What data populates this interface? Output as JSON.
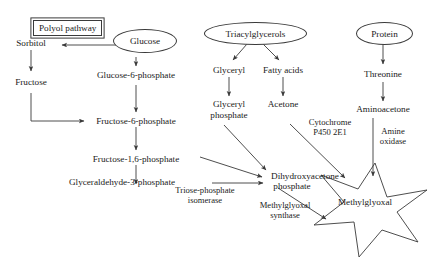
{
  "diagram": {
    "background_color": "#ffffff",
    "line_color": "#3a3a3a",
    "text_color": "#1a1a1a",
    "sources": {
      "glucose": "Glucose",
      "triacylglycerols": "Triacylglycerols",
      "protein": "Protein"
    },
    "box": {
      "polyol_pathway": "Polyol pathway"
    },
    "polyol_branch": {
      "sorbitol": "Sorbitol",
      "fructose": "Fructose"
    },
    "glycolysis": {
      "glucose_6_phosphate": "Glucose-6-phosphate",
      "fructose_6_phosphate": "Fructose-6-phosphate",
      "fructose_1_6_phosphate": "Fructose-1,6-phosphate",
      "glyceraldehyde_3_phosphate": "Glyceraldehyde-3-phosphate",
      "dihydroxyacetone_phosphate_line1": "Dihydroxyacetone",
      "dihydroxyacetone_phosphate_line2": "phosphate"
    },
    "lipid_branch": {
      "glyceryl": "Glyceryl",
      "fatty_acids": "Fatty acids",
      "glyceryl_phosphate_line1": "Glyceryl",
      "glyceryl_phosphate_line2": "phosphate",
      "acetone": "Acetone"
    },
    "protein_branch": {
      "threonine": "Threonine",
      "aminoacetone": "Aminoacetone"
    },
    "enzymes": {
      "triose_phosphate_isomerase_line1": "Triose-phosphate",
      "triose_phosphate_isomerase_line2": "isomerase",
      "methylglyoxal_synthase_line1": "Methylglyoxal",
      "methylglyoxal_synthase_line2": "synthase",
      "cytochrome_line1": "Cytochrome",
      "cytochrome_line2": "P450 2E1",
      "amine_oxidase_line1": "Amine",
      "amine_oxidase_line2": "oxidase"
    },
    "product": {
      "methylglyoxal": "Methylglyoxal"
    }
  }
}
